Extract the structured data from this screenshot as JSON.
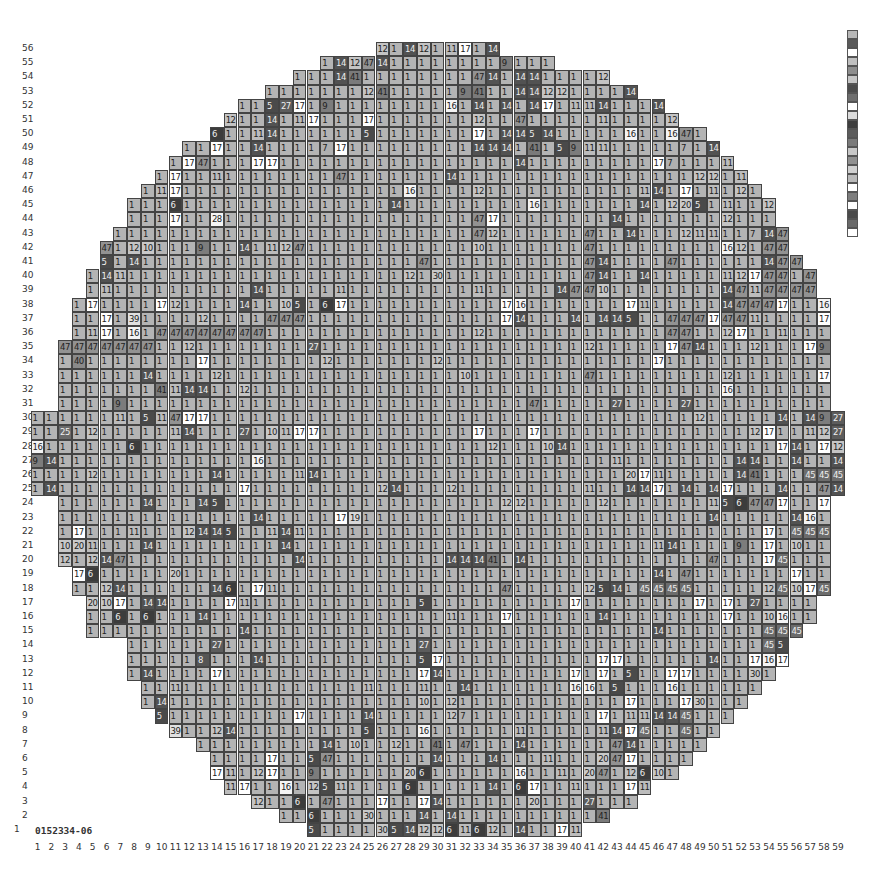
{
  "wafer_id": "0152334-06",
  "chart_data": {
    "type": "heatmap",
    "xlabel": "Column",
    "ylabel": "Row",
    "x_ticks": [
      1,
      2,
      3,
      4,
      5,
      6,
      7,
      8,
      9,
      10,
      11,
      12,
      13,
      14,
      15,
      16,
      17,
      18,
      19,
      20,
      21,
      22,
      23,
      24,
      25,
      26,
      27,
      28,
      29,
      30,
      31,
      32,
      33,
      34,
      35,
      36,
      37,
      38,
      39,
      40,
      41,
      42,
      43,
      44,
      45,
      46,
      47,
      48,
      49,
      50,
      51,
      52,
      53,
      54,
      55,
      56,
      57,
      58,
      59
    ],
    "y_ticks": [
      1,
      2,
      3,
      4,
      5,
      6,
      7,
      8,
      9,
      10,
      11,
      12,
      13,
      14,
      15,
      16,
      17,
      18,
      19,
      20,
      21,
      22,
      23,
      24,
      25,
      26,
      27,
      28,
      29,
      30,
      31,
      32,
      33,
      34,
      35,
      36,
      37,
      38,
      39,
      40,
      41,
      42,
      43,
      44,
      45,
      46,
      47,
      48,
      49,
      50,
      51,
      52,
      53,
      54,
      55,
      56
    ],
    "default_bin": "1",
    "row_extents": {
      "56": [
        26,
        34
      ],
      "55": [
        22,
        38
      ],
      "54": [
        20,
        42
      ],
      "53": [
        18,
        44
      ],
      "52": [
        16,
        46
      ],
      "51": [
        15,
        47
      ],
      "50": [
        14,
        49
      ],
      "49": [
        12,
        50
      ],
      "48": [
        11,
        51
      ],
      "47": [
        10,
        52
      ],
      "46": [
        9,
        53
      ],
      "45": [
        8,
        54
      ],
      "44": [
        8,
        54
      ],
      "43": [
        7,
        55
      ],
      "42": [
        6,
        55
      ],
      "41": [
        6,
        56
      ],
      "40": [
        5,
        57
      ],
      "39": [
        5,
        57
      ],
      "38": [
        4,
        58
      ],
      "37": [
        4,
        58
      ],
      "36": [
        4,
        58
      ],
      "35": [
        3,
        58
      ],
      "34": [
        3,
        58
      ],
      "33": [
        3,
        58
      ],
      "32": [
        3,
        58
      ],
      "31": [
        3,
        58
      ],
      "30": [
        1,
        59
      ],
      "29": [
        1,
        59
      ],
      "28": [
        1,
        59
      ],
      "27": [
        1,
        59
      ],
      "26": [
        1,
        59
      ],
      "25": [
        1,
        59
      ],
      "24": [
        3,
        58
      ],
      "23": [
        3,
        58
      ],
      "22": [
        3,
        58
      ],
      "21": [
        3,
        58
      ],
      "20": [
        3,
        58
      ],
      "19": [
        4,
        58
      ],
      "18": [
        4,
        58
      ],
      "17": [
        5,
        57
      ],
      "16": [
        5,
        57
      ],
      "15": [
        5,
        56
      ],
      "14": [
        8,
        55
      ],
      "13": [
        8,
        55
      ],
      "12": [
        8,
        54
      ],
      "11": [
        9,
        53
      ],
      "10": [
        9,
        52
      ],
      "9": [
        10,
        51
      ],
      "8": [
        11,
        50
      ],
      "7": [
        13,
        49
      ],
      "6": [
        14,
        48
      ],
      "5": [
        14,
        47
      ],
      "4": [
        15,
        45
      ],
      "3": [
        17,
        44
      ],
      "2": [
        19,
        42
      ],
      "1": [
        21,
        40
      ]
    },
    "cells": {
      "56": {
        "26": "12",
        "28": "14",
        "29": "12",
        "31": "11",
        "32": "17",
        "34": "14"
      },
      "55": {
        "23": "14",
        "24": "12",
        "25": "47",
        "26": "14",
        "35": "9"
      },
      "54": {
        "23": "14",
        "24": "41",
        "33": "47",
        "34": "14",
        "36": "14",
        "37": "14",
        "42": "12"
      },
      "53": {
        "25": "12",
        "26": "41",
        "32": "9",
        "33": "41",
        "36": "14",
        "37": "14",
        "38": "12",
        "39": "12",
        "44": "14"
      },
      "52": {
        "18": "5",
        "19": "27",
        "20": "17",
        "22": "9",
        "31": "16",
        "33": "14",
        "35": "14",
        "37": "14",
        "38": "17",
        "40": "11",
        "41": "11",
        "42": "14",
        "46": "14"
      },
      "51": {
        "15": "12",
        "18": "14",
        "20": "11",
        "21": "17",
        "25": "17",
        "33": "12",
        "36": "47",
        "42": "11",
        "47": "12"
      },
      "50": {
        "14": "6",
        "17": "11",
        "18": "14",
        "25": "5",
        "33": "17",
        "35": "14",
        "36": "14",
        "37": "5",
        "38": "14",
        "44": "16",
        "47": "16",
        "48": "47"
      },
      "49": {
        "14": "17",
        "17": "14",
        "22": "7",
        "23": "17",
        "33": "14",
        "34": "14",
        "35": "14",
        "37": "41",
        "39": "5",
        "40": "9",
        "41": "11",
        "42": "11",
        "48": "7",
        "50": "14"
      },
      "48": {
        "12": "17",
        "13": "47",
        "17": "17",
        "18": "17",
        "36": "14",
        "46": "17",
        "47": "7",
        "51": "11"
      },
      "47": {
        "11": "17",
        "14": "11",
        "23": "47",
        "31": "14",
        "49": "12",
        "50": "12",
        "52": "11"
      },
      "46": {
        "10": "11",
        "11": "17",
        "28": "16",
        "33": "12",
        "45": "11",
        "46": "14",
        "48": "17",
        "50": "11",
        "52": "12"
      },
      "45": {
        "11": "6",
        "27": "14",
        "37": "16",
        "45": "14",
        "47": "12",
        "48": "20",
        "49": "5",
        "51": "11",
        "54": "12"
      },
      "44": {
        "11": "17",
        "12": "1",
        "14": "28",
        "33": "47",
        "34": "17",
        "43": "14",
        "51": "12"
      },
      "43": {
        "33": "47",
        "34": "12",
        "41": "47",
        "44": "14",
        "48": "12",
        "49": "11",
        "50": "11",
        "53": "7",
        "54": "14",
        "55": "47"
      },
      "42": {
        "6": "47",
        "8": "12",
        "9": "10",
        "13": "9",
        "16": "14",
        "18": "11",
        "19": "12",
        "20": "47",
        "33": "10",
        "41": "47",
        "51": "16",
        "52": "12",
        "54": "47",
        "55": "47"
      },
      "41": {
        "6": "5",
        "8": "14",
        "29": "47",
        "41": "47",
        "42": "14",
        "47": "47",
        "54": "14",
        "55": "47",
        "56": "47"
      },
      "40": {
        "6": "14",
        "7": "11",
        "28": "12",
        "30": "30",
        "41": "47",
        "42": "14",
        "45": "14",
        "51": "11",
        "52": "12",
        "53": "17",
        "54": "47",
        "55": "47",
        "57": "47"
      },
      "39": {
        "6": "11",
        "17": "14",
        "23": "11",
        "33": "11",
        "39": "14",
        "40": "47",
        "41": "47",
        "42": "10",
        "51": "14",
        "52": "47",
        "53": "11",
        "54": "47",
        "55": "47",
        "56": "47",
        "57": "47"
      },
      "38": {
        "5": "17",
        "10": "17",
        "11": "12",
        "16": "14",
        "19": "10",
        "20": "5",
        "22": "6",
        "23": "17",
        "35": "17",
        "36": "16",
        "44": "17",
        "45": "11",
        "51": "14",
        "52": "47",
        "53": "47",
        "54": "47",
        "55": "17",
        "58": "16"
      },
      "37": {
        "6": "17",
        "8": "39",
        "13": "12",
        "18": "47",
        "19": "47",
        "20": "47",
        "35": "17",
        "36": "14",
        "40": "14",
        "42": "14",
        "43": "14",
        "44": "5",
        "47": "47",
        "48": "47",
        "49": "47",
        "50": "17",
        "51": "47",
        "52": "47",
        "53": "11",
        "58": "17"
      },
      "36": {
        "5": "11",
        "6": "17",
        "8": "16",
        "10": "47",
        "11": "47",
        "12": "47",
        "13": "47",
        "14": "47",
        "15": "47",
        "16": "47",
        "17": "47",
        "18": "1",
        "33": "12",
        "47": "47",
        "48": "47",
        "51": "12",
        "52": "17",
        "55": "11"
      },
      "35": {
        "3": "47",
        "4": "47",
        "5": "47",
        "6": "47",
        "7": "47",
        "8": "47",
        "9": "47",
        "12": "12",
        "21": "27",
        "41": "12",
        "47": "17",
        "48": "47",
        "49": "14",
        "53": "12",
        "57": "17",
        "58": "9"
      },
      "34": {
        "4": "40",
        "13": "17",
        "22": "12",
        "30": "12",
        "46": "17"
      },
      "33": {
        "9": "14",
        "14": "12",
        "32": "10",
        "41": "47",
        "51": "12",
        "58": "17"
      },
      "32": {
        "10": "41",
        "11": "11",
        "12": "14",
        "13": "14",
        "16": "12",
        "51": "16"
      },
      "31": {
        "7": "9",
        "37": "47",
        "43": "27",
        "48": "27"
      },
      "30": {
        "7": "11",
        "9": "5",
        "10": "11",
        "11": "47",
        "12": "17",
        "13": "17",
        "49": "12",
        "55": "14",
        "57": "14",
        "58": "9",
        "59": "27"
      },
      "29": {
        "3": "25",
        "5": "12",
        "11": "11",
        "12": "14",
        "16": "27",
        "18": "10",
        "19": "11",
        "20": "17",
        "21": "17",
        "33": "17",
        "37": "17",
        "53": "12",
        "54": "17",
        "57": "11",
        "58": "12",
        "59": "27"
      },
      "28": {
        "1": "16",
        "8": "6",
        "34": "12",
        "38": "10",
        "39": "14",
        "55": "17",
        "56": "14",
        "58": "17",
        "59": "12"
      },
      "27": {
        "1": "9",
        "2": "14",
        "17": "16",
        "43": "11",
        "52": "14",
        "53": "14",
        "56": "14",
        "59": "14"
      },
      "26": {
        "5": "12",
        "14": "14",
        "20": "11",
        "21": "14",
        "44": "20",
        "45": "17",
        "46": "11",
        "52": "14",
        "53": "41",
        "57": "45",
        "58": "45",
        "59": "45"
      },
      "25": {
        "2": "14",
        "16": "17",
        "26": "12",
        "27": "14",
        "31": "12",
        "41": "11",
        "44": "14",
        "45": "14",
        "46": "17",
        "48": "14",
        "50": "14",
        "51": "17",
        "55": "14",
        "58": "47",
        "59": "14"
      },
      "24": {
        "9": "14",
        "13": "14",
        "14": "5",
        "35": "12",
        "36": "12",
        "42": "12",
        "50": "11",
        "51": "5",
        "52": "6",
        "53": "47",
        "54": "47",
        "55": "17",
        "58": "17"
      },
      "23": {
        "17": "14",
        "23": "17",
        "24": "19",
        "50": "14",
        "56": "14",
        "57": "16"
      },
      "22": {
        "4": "17",
        "8": "11",
        "12": "12",
        "13": "14",
        "14": "14",
        "15": "5",
        "18": "11",
        "19": "14",
        "20": "11",
        "54": "17",
        "56": "45",
        "57": "45",
        "58": "45"
      },
      "21": {
        "3": "10",
        "4": "20",
        "5": "11",
        "9": "14",
        "19": "14",
        "46": "11",
        "47": "14",
        "52": "9",
        "54": "17",
        "56": "10"
      },
      "20": {
        "3": "12",
        "5": "12",
        "6": "14",
        "7": "47",
        "20": "14",
        "31": "14",
        "32": "14",
        "33": "14",
        "34": "41",
        "36": "14",
        "50": "47",
        "54": "17",
        "55": "45"
      },
      "19": {
        "4": "17",
        "5": "6",
        "11": "20",
        "46": "14",
        "48": "47",
        "56": "17"
      },
      "18": {
        "6": "12",
        "7": "14",
        "14": "14",
        "15": "6",
        "17": "17",
        "18": "11",
        "35": "47",
        "41": "12",
        "42": "5",
        "43": "14",
        "45": "45",
        "46": "45",
        "47": "45",
        "48": "45",
        "54": "12",
        "55": "45",
        "56": "10",
        "57": "17",
        "58": "45"
      },
      "17": {
        "5": "20",
        "6": "10",
        "7": "17",
        "9": "14",
        "10": "14",
        "15": "17",
        "16": "11",
        "29": "5",
        "40": "17",
        "49": "17",
        "51": "17",
        "53": "27"
      },
      "16": {
        "7": "6",
        "9": "6",
        "13": "14",
        "31": "11",
        "35": "17",
        "42": "14",
        "51": "17",
        "54": "10",
        "55": "16"
      },
      "15": {
        "16": "14",
        "46": "14",
        "54": "45",
        "55": "45",
        "56": "45",
        "57": "11"
      },
      "14": {
        "14": "27",
        "29": "27",
        "54": "45",
        "55": "5"
      },
      "13": {
        "13": "8",
        "17": "14",
        "29": "5",
        "30": "17",
        "42": "17",
        "43": "17",
        "50": "14",
        "53": "17",
        "54": "16",
        "55": "17"
      },
      "12": {
        "9": "14",
        "14": "17",
        "29": "17",
        "30": "14",
        "40": "17",
        "42": "17",
        "44": "5",
        "47": "17",
        "48": "17",
        "53": "30"
      },
      "11": {
        "11": "11",
        "25": "11",
        "29": "11",
        "32": "14",
        "40": "16",
        "41": "16",
        "43": "5",
        "47": "16"
      },
      "10": {
        "10": "14",
        "29": "10",
        "31": "12",
        "44": "17",
        "48": "17",
        "49": "30"
      },
      "9": {
        "10": "5",
        "20": "17",
        "25": "14",
        "31": "12",
        "32": "7",
        "42": "17",
        "44": "11",
        "45": "11",
        "46": "14",
        "47": "14",
        "48": "45"
      },
      "8": {
        "11": "39",
        "14": "12",
        "15": "14",
        "25": "5",
        "29": "16",
        "36": "11",
        "42": "11",
        "43": "14",
        "44": "17",
        "45": "45",
        "48": "45"
      },
      "7": {
        "22": "14",
        "24": "10",
        "27": "12",
        "30": "41",
        "32": "47",
        "36": "14",
        "43": "47",
        "44": "14"
      },
      "6": {
        "18": "17",
        "21": "5",
        "22": "47",
        "30": "14",
        "34": "14",
        "38": "11",
        "42": "20",
        "43": "47",
        "44": "17"
      },
      "5": {
        "14": "17",
        "15": "11",
        "17": "12",
        "18": "17",
        "21": "9",
        "28": "20",
        "29": "6",
        "36": "16",
        "39": "11",
        "41": "20",
        "42": "47",
        "44": "12",
        "45": "6",
        "46": "10"
      },
      "4": {
        "15": "11",
        "16": "17",
        "19": "16",
        "21": "12",
        "22": "5",
        "23": "11",
        "28": "6",
        "34": "14",
        "36": "6",
        "37": "17",
        "38": "1",
        "40": "11",
        "44": "17",
        "45": "11"
      },
      "3": {
        "17": "12",
        "20": "6",
        "22": "47",
        "26": "17",
        "29": "17",
        "30": "14",
        "37": "20",
        "41": "27"
      },
      "2": {
        "21": "6",
        "25": "30",
        "29": "14",
        "31": "14",
        "42": "41"
      },
      "1": {
        "21": "5",
        "26": "30",
        "27": "5",
        "28": "14",
        "29": "12",
        "30": "12",
        "31": "6",
        "32": "11",
        "33": "6",
        "34": "12",
        "36": "14",
        "38": "1",
        "39": "17",
        "40": "11",
        "41": "17"
      }
    },
    "bin_colors": {
      "1": "#b4b4b4",
      "5": "#4a4a4a",
      "6": "#3c3c3c",
      "7": "#b0b0b0",
      "8": "#555555",
      "9": "#7c7c7c",
      "10": "#c8c8c8",
      "11": "#bcbcbc",
      "12": "#c4c4c4",
      "14": "#525252",
      "16": "#f4f4f4",
      "17": "#ffffff",
      "19": "#d8d8d8",
      "20": "#cacaca",
      "25": "#6a6a6a",
      "27": "#5c5c5c",
      "28": "#f4f4f4",
      "30": "#c8c8c8",
      "39": "#e0e0e0",
      "40": "#8a8a8a",
      "41": "#7a7a7a",
      "45": "#6c6c6c",
      "47": "#929292"
    },
    "light_text_bins": [
      "5",
      "6",
      "8",
      "14",
      "25",
      "27",
      "45"
    ],
    "legend": {
      "position": "right",
      "swatches": [
        "#b8b8b8",
        "#5a5a5a",
        "#ffffff",
        "#c0c0c0",
        "#8e8e8e",
        "#c6c6c6",
        "#4c4c4c",
        "#6e6e6e",
        "#ffffff",
        "#dcdcdc",
        "#3e3e3e",
        "#5c5c5c",
        "#7a7a7a",
        "#c8c8c8",
        "#909090",
        "#d0d0d0",
        "#bababa",
        "#ffffff",
        "#7e7e7e",
        "#ffffff",
        "#4a4a4a",
        "#6a6a6a",
        "#ffffff"
      ]
    }
  }
}
